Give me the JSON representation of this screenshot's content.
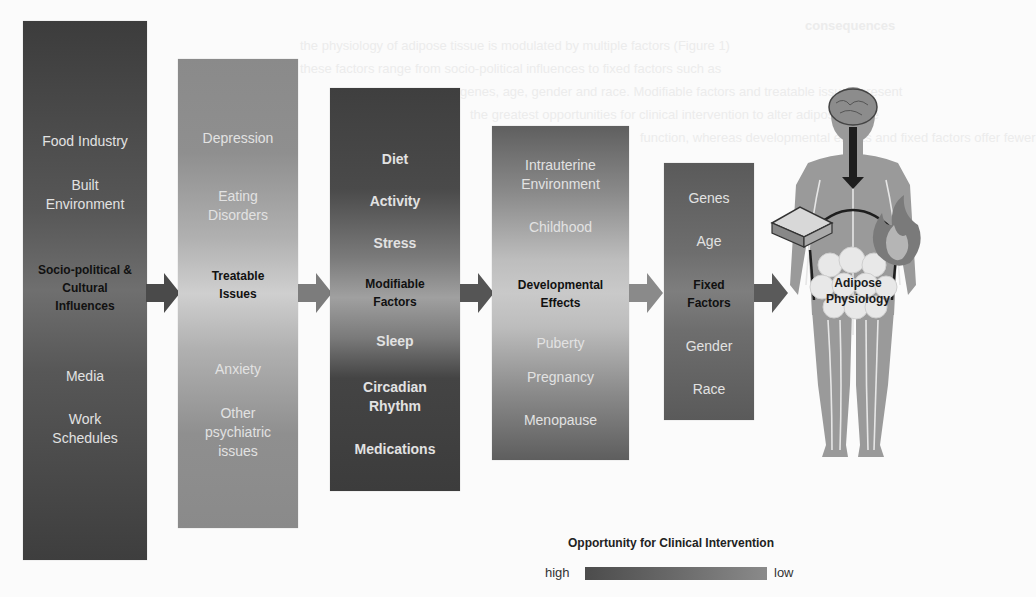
{
  "background_text": {
    "heading": "consequences",
    "lines": [
      "the physiology of adipose tissue is modulated by multiple factors (Figure 1)",
      "these factors range from socio-political influences to fixed factors such as",
      "genes, age, gender and race. Modifiable factors and treatable issues present",
      "the greatest opportunities for clinical intervention to alter adipose tissue",
      "function, whereas developmental effects and fixed factors offer fewer"
    ]
  },
  "columns": [
    {
      "id": "socio-political",
      "items": [
        {
          "text": "Food Industry",
          "type": "normal"
        },
        {
          "text": "Built Environment",
          "type": "normal"
        },
        {
          "text": "Socio-political & Cultural Influences",
          "type": "hub"
        },
        {
          "text": "Media",
          "type": "normal"
        },
        {
          "text": "Work Schedules",
          "type": "normal"
        }
      ]
    },
    {
      "id": "treatable",
      "items": [
        {
          "text": "Depression",
          "type": "normal"
        },
        {
          "text": "Eating Disorders",
          "type": "normal"
        },
        {
          "text": "Treatable Issues",
          "type": "hub"
        },
        {
          "text": "Anxiety",
          "type": "normal"
        },
        {
          "text": "Other psychiatric issues",
          "type": "normal"
        }
      ]
    },
    {
      "id": "modifiable",
      "items": [
        {
          "text": "Diet",
          "type": "bold"
        },
        {
          "text": "Activity",
          "type": "bold"
        },
        {
          "text": "Stress",
          "type": "bold"
        },
        {
          "text": "Modifiable Factors",
          "type": "hub"
        },
        {
          "text": "Sleep",
          "type": "bold"
        },
        {
          "text": "Circadian Rhythm",
          "type": "bold"
        },
        {
          "text": "Medications",
          "type": "bold"
        }
      ]
    },
    {
      "id": "developmental",
      "items": [
        {
          "text": "Intrauterine Environment",
          "type": "normal"
        },
        {
          "text": "Childhood",
          "type": "normal"
        },
        {
          "text": "Developmental Effects",
          "type": "hub"
        },
        {
          "text": "Puberty",
          "type": "normal"
        },
        {
          "text": "Pregnancy",
          "type": "normal"
        },
        {
          "text": "Menopause",
          "type": "normal"
        }
      ]
    },
    {
      "id": "fixed",
      "items": [
        {
          "text": "Genes",
          "type": "normal"
        },
        {
          "text": "Age",
          "type": "normal"
        },
        {
          "text": "Fixed Factors",
          "type": "hub"
        },
        {
          "text": "Gender",
          "type": "normal"
        },
        {
          "text": "Race",
          "type": "normal"
        }
      ]
    }
  ],
  "target": {
    "label": "Adipose Physiology",
    "icons": [
      "brain-icon",
      "sandwich-icon",
      "flame-icon",
      "fat-cells-icon",
      "human-body-icon"
    ]
  },
  "legend": {
    "title": "Opportunity for Clinical Intervention",
    "high_label": "high",
    "low_label": "low",
    "colors": {
      "high": "#4c4c4c",
      "low": "#8a8a8a"
    }
  },
  "arrow_colors": [
    "#4a4a4a",
    "#7c7c7c",
    "#555555",
    "#8a8a8a",
    "#5a5a5a"
  ]
}
